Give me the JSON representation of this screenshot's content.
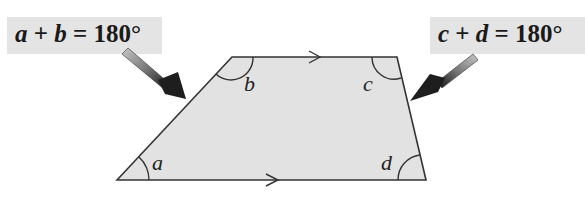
{
  "diagram": {
    "equations": [
      {
        "var1": "a",
        "op": "+",
        "var2": "b",
        "eq": "=",
        "value": "180°"
      },
      {
        "var1": "c",
        "op": "+",
        "var2": "d",
        "eq": "=",
        "value": "180°"
      }
    ],
    "angles": {
      "a": "a",
      "b": "b",
      "c": "c",
      "d": "d"
    },
    "colors": {
      "fill": "#e2e2e2",
      "stroke": "#333333",
      "label_bg": "#e4e4e4",
      "arrow_dark": "#222222",
      "arrow_light": "#aaaaaa"
    }
  }
}
